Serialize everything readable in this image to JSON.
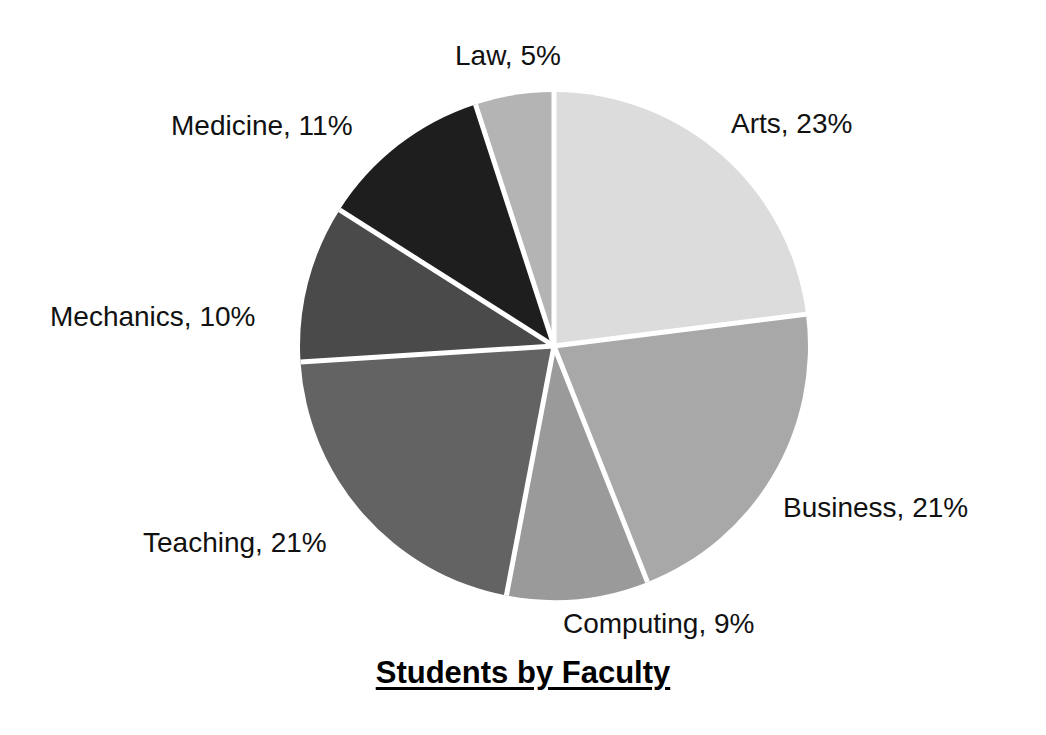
{
  "chart_data": {
    "type": "pie",
    "title": "Students by Faculty",
    "xlabel": "",
    "ylabel": "",
    "legend_position": "none",
    "grid": false,
    "unit": "%",
    "start_angle_deg": 0,
    "direction": "clockwise",
    "categories": [
      "Arts",
      "Business",
      "Computing",
      "Teaching",
      "Mechanics",
      "Medicine",
      "Law"
    ],
    "values": [
      23,
      21,
      9,
      21,
      10,
      11,
      5
    ],
    "total": 100,
    "slices": [
      {
        "label": "Arts",
        "value": 23,
        "text": "Arts, 23%",
        "color": "#dcdcdc"
      },
      {
        "label": "Business",
        "value": 21,
        "text": "Business, 21%",
        "color": "#a8a8a8"
      },
      {
        "label": "Computing",
        "value": 9,
        "text": "Computing, 9%",
        "color": "#9a9a9a"
      },
      {
        "label": "Teaching",
        "value": 21,
        "text": "Teaching, 21%",
        "color": "#636363"
      },
      {
        "label": "Mechanics",
        "value": 10,
        "text": "Mechanics, 10%",
        "color": "#4a4a4a"
      },
      {
        "label": "Medicine",
        "value": 11,
        "text": "Medicine, 11%",
        "color": "#1e1e1e"
      },
      {
        "label": "Law",
        "value": 5,
        "text": "Law, 5%",
        "color": "#b4b4b4"
      }
    ],
    "separator_color": "#ffffff",
    "background_color": "#ffffff",
    "text_color": "#111111"
  },
  "labels": {
    "arts": "Arts, 23%",
    "business": "Business, 21%",
    "computing": "Computing, 9%",
    "teaching": "Teaching, 21%",
    "mechanics": "Mechanics, 10%",
    "medicine": "Medicine, 11%",
    "law": "Law, 5%"
  },
  "title": {
    "text": "Students by Faculty"
  },
  "geometry": {
    "center_x": 554,
    "center_y": 346,
    "radius": 254
  }
}
